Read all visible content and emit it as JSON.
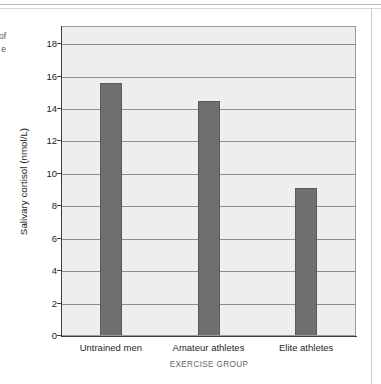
{
  "page": {
    "caption_fragment_lines": [
      "of",
      "e"
    ]
  },
  "chart_data": {
    "type": "bar",
    "title": "",
    "xlabel": "EXERCISE GROUP",
    "ylabel": "Salivary cortisol (nmol/L)",
    "categories": [
      "Untrained men",
      "Amateur athletes",
      "Elite athletes"
    ],
    "values": [
      15.6,
      14.5,
      9.15
    ],
    "ylim": [
      0,
      19
    ],
    "yticks": [
      0,
      2,
      4,
      6,
      8,
      10,
      12,
      14,
      16,
      18
    ],
    "ytick_labels": [
      "0",
      "2",
      "4",
      "6",
      "8",
      "10",
      "12",
      "14",
      "16",
      "18"
    ],
    "grid": "horizontal",
    "legend": "none",
    "bar_color": "#6f6f6f",
    "plot_background": "#eeeeee",
    "gridline_color": "#8e8e8e",
    "axis_color": "#3c3c3c"
  }
}
